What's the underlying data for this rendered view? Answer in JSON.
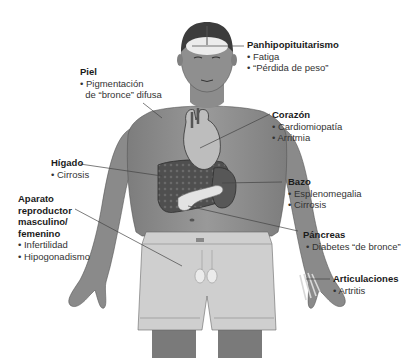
{
  "figure": {
    "colors": {
      "skin": "#8f8f8f",
      "skin_dark": "#6e6e6e",
      "organ_dark": "#4a4a4a",
      "organ_light": "#d4d4d4",
      "shorts": "#c9c9c9",
      "leader_line": "#444444",
      "text": "#1a1a1a"
    }
  },
  "labels": {
    "pituitary": {
      "title": "Panhipopituitarismo",
      "items": [
        "Fatiga",
        "“Pérdida de peso”"
      ]
    },
    "skin": {
      "title": "Piel",
      "items": [
        "Pigmentación",
        "de “bronce” difusa"
      ]
    },
    "heart": {
      "title": "Corazón",
      "items": [
        "Cardiomiopatía",
        "Arritmia"
      ]
    },
    "liver": {
      "title": "Hígado",
      "items": [
        "Cirrosis"
      ]
    },
    "spleen": {
      "title": "Bazo",
      "items": [
        "Esplenomegalia",
        "Cirrosis"
      ]
    },
    "reproductive": {
      "title_lines": [
        "Aparato",
        "reproductor",
        "masculino/",
        "femenino"
      ],
      "items": [
        "Infertilidad",
        "Hipogonadismo"
      ]
    },
    "pancreas": {
      "title": "Páncreas",
      "items": [
        "Diabetes “de bronce”"
      ]
    },
    "joints": {
      "title": "Articulaciones",
      "items": [
        "Artritis"
      ]
    }
  }
}
